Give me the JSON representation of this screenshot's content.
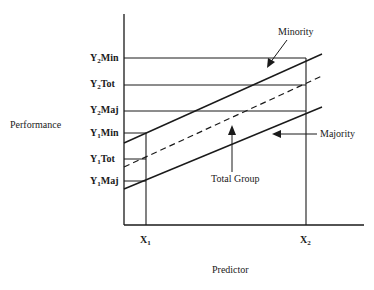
{
  "diagram": {
    "y_axis_title": "Performance",
    "x_axis_title": "Predictor",
    "x_ticks": [
      {
        "base": "X",
        "sub": "1"
      },
      {
        "base": "X",
        "sub": "2"
      }
    ],
    "y_ticks": [
      {
        "base": "Y",
        "sub": "2",
        "suffix": "Min"
      },
      {
        "base": "Y",
        "sub": "2",
        "suffix": "Tot"
      },
      {
        "base": "Y",
        "sub": "2",
        "suffix": "Maj"
      },
      {
        "base": "Y",
        "sub": "1",
        "suffix": "Min"
      },
      {
        "base": "Y",
        "sub": "1",
        "suffix": "Tot"
      },
      {
        "base": "Y",
        "sub": "1",
        "suffix": "Maj"
      }
    ],
    "annotations": {
      "minority": "Minority",
      "majority": "Majority",
      "total": "Total Group"
    },
    "line_color": "#1a1a1a"
  }
}
